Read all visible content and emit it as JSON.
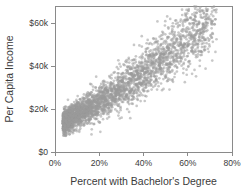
{
  "chart_data": {
    "type": "scatter",
    "title": "",
    "xlabel": "Percent with Bachelor's Degree",
    "ylabel": "Per Capita Income",
    "xlim": [
      0,
      80
    ],
    "ylim": [
      0,
      68000
    ],
    "grid": false,
    "legend": null,
    "xticks": [
      0,
      20,
      40,
      60,
      80
    ],
    "xticklabels": [
      "0%",
      "20%",
      "40%",
      "60%",
      "80%"
    ],
    "yticks": [
      0,
      20000,
      40000,
      60000
    ],
    "yticklabels": [
      "$0",
      "$20k",
      "$40k",
      "$60k"
    ],
    "marker": {
      "color": "#9a9a9a",
      "radius": 1.35,
      "opacity": 0.55,
      "shape": "circle"
    },
    "n_points": 3140,
    "cluster_model": {
      "x_min": 4.0,
      "x_max": 72.0,
      "x_mode": 14.0,
      "x_skew": 2.05,
      "intercept": 11800,
      "slope": 560,
      "curvature": 4.2,
      "scatter_base": 2450,
      "scatter_growth": 88,
      "seed": 20240817
    },
    "notable_points": [
      {
        "x": 57.5,
        "y": 63800
      },
      {
        "x": 55.5,
        "y": 58200
      },
      {
        "x": 70.8,
        "y": 57600
      },
      {
        "x": 60.5,
        "y": 55600
      },
      {
        "x": 70.2,
        "y": 54200
      },
      {
        "x": 62.0,
        "y": 50200
      },
      {
        "x": 52.0,
        "y": 49600
      },
      {
        "x": 46.5,
        "y": 48100
      },
      {
        "x": 41.0,
        "y": 46600
      },
      {
        "x": 48.5,
        "y": 44200
      },
      {
        "x": 16.5,
        "y": 8200
      },
      {
        "x": 20.5,
        "y": 9400
      },
      {
        "x": 11.0,
        "y": 10200
      }
    ]
  },
  "plot_geometry": {
    "left": 55,
    "right": 232,
    "top": 6,
    "bottom": 152
  }
}
